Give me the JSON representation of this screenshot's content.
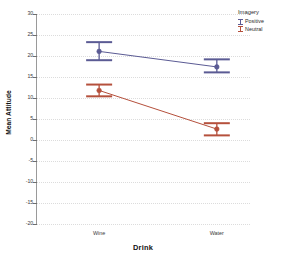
{
  "chart_data": {
    "type": "line",
    "title": "",
    "xlabel": "Drink",
    "ylabel": "Mean Attitude",
    "categories": [
      "Wine",
      "Water"
    ],
    "ylim": [
      -20,
      30
    ],
    "yticks": [
      30,
      25,
      20,
      15,
      10,
      5,
      0,
      -5,
      -10,
      -15,
      -20
    ],
    "ytick_labels": [
      "30",
      "25",
      "20",
      "15",
      "10",
      "5",
      "0",
      "-5",
      "-10",
      "-15",
      "-20"
    ],
    "grid": true,
    "legend_position": "top-right",
    "legend_title": "Imagery",
    "error_bars": "95% CI",
    "series": [
      {
        "name": "Positive",
        "color": "#5b5b94",
        "values": [
          21.1,
          17.4
        ],
        "error_low": [
          19.0,
          16.1
        ],
        "error_high": [
          23.3,
          19.2
        ]
      },
      {
        "name": "Neutral",
        "color": "#b5503c",
        "values": [
          11.8,
          2.6
        ],
        "error_low": [
          10.4,
          1.1
        ],
        "error_high": [
          13.2,
          4.0
        ]
      }
    ]
  },
  "legend": {
    "title": "Imagery",
    "entries": [
      {
        "label": "Positive",
        "color": "#5b5b94"
      },
      {
        "label": "Neutral",
        "color": "#b5503c"
      }
    ]
  },
  "axes": {
    "x_title": "Drink",
    "y_title": "Mean Attitude"
  }
}
